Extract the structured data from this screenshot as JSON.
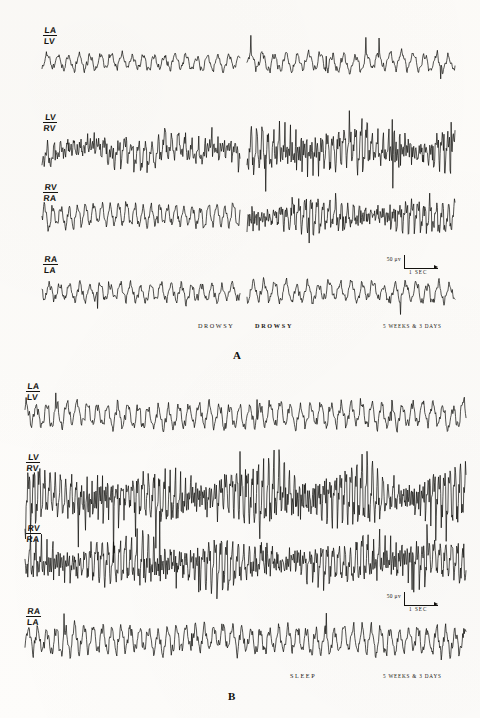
{
  "figure": {
    "type": "eeg-polygraph-recording",
    "width": 480,
    "height": 718,
    "background_color": "#fdfcfa",
    "trace_color": "#100f0d"
  },
  "panels": [
    {
      "id": "A",
      "letter": "A",
      "letter_pos": {
        "x": 233,
        "y": 349
      },
      "segmented": true,
      "segments": [
        {
          "x_start": 42,
          "x_end": 240
        },
        {
          "x_start": 247,
          "x_end": 455
        }
      ],
      "rows": [
        {
          "label_numerator": "LA",
          "label_denominator": "LV",
          "label_pos": {
            "x": 43,
            "y": 26
          },
          "baseline_y": 62,
          "segment_params": [
            {
              "amp": 6.5,
              "freq": 1.0,
              "noise": 0.52,
              "spindle": 0.1,
              "slow": 1.8,
              "seed": 11
            },
            {
              "amp": 7.2,
              "freq": 0.92,
              "noise": 0.56,
              "spindle": 0.14,
              "slow": 2.6,
              "seed": 12
            }
          ]
        },
        {
          "label_numerator": "LV",
          "label_denominator": "RV",
          "label_pos": {
            "x": 43,
            "y": 113
          },
          "baseline_y": 150,
          "segment_params": [
            {
              "amp": 11.5,
              "freq": 1.55,
              "noise": 0.3,
              "spindle": 0.55,
              "slow": 7.5,
              "seed": 21
            },
            {
              "amp": 15.5,
              "freq": 1.85,
              "noise": 0.22,
              "spindle": 0.8,
              "slow": 4.5,
              "seed": 22
            }
          ]
        },
        {
          "label_numerator": "RV",
          "label_denominator": "RA",
          "label_pos": {
            "x": 43,
            "y": 183
          },
          "baseline_y": 216,
          "segment_params": [
            {
              "amp": 8.0,
              "freq": 1.3,
              "noise": 0.45,
              "spindle": 0.25,
              "slow": 2.8,
              "seed": 31
            },
            {
              "amp": 12.5,
              "freq": 1.7,
              "noise": 0.32,
              "spindle": 0.6,
              "slow": 3.2,
              "seed": 32
            }
          ]
        },
        {
          "label_numerator": "RA",
          "label_denominator": "LA",
          "label_pos": {
            "x": 43,
            "y": 255
          },
          "baseline_y": 292,
          "segment_params": [
            {
              "amp": 6.8,
              "freq": 1.05,
              "noise": 0.58,
              "spindle": 0.12,
              "slow": 2.0,
              "seed": 41
            },
            {
              "amp": 7.6,
              "freq": 0.98,
              "noise": 0.6,
              "spindle": 0.16,
              "slow": 2.4,
              "seed": 42
            }
          ]
        }
      ],
      "calibration": {
        "pos": {
          "x": 404,
          "y": 255
        },
        "amplitude_label": "50 μv",
        "time_label": "1 SEC"
      },
      "annotations": [
        {
          "text": "DROWSY",
          "x": 198,
          "y": 322,
          "bold": false
        },
        {
          "text": "DROWSY",
          "x": 255,
          "y": 322,
          "bold": true
        },
        {
          "text": "5 WEEKS & 3 DAYS",
          "x": 383,
          "y": 323,
          "bold": false,
          "small": true
        }
      ]
    },
    {
      "id": "B",
      "letter": "B",
      "letter_pos": {
        "x": 228,
        "y": 690
      },
      "segmented": false,
      "segments": [
        {
          "x_start": 25,
          "x_end": 466
        }
      ],
      "rows": [
        {
          "label_numerator": "LA",
          "label_denominator": "LV",
          "label_pos": {
            "x": 26,
            "y": 382
          },
          "baseline_y": 415,
          "segment_params": [
            {
              "amp": 9.5,
              "freq": 1.05,
              "noise": 0.55,
              "spindle": 0.18,
              "slow": 3.2,
              "seed": 51
            }
          ]
        },
        {
          "label_numerator": "LV",
          "label_denominator": "RV",
          "label_pos": {
            "x": 26,
            "y": 453
          },
          "baseline_y": 495,
          "segment_params": [
            {
              "amp": 19.0,
              "freq": 1.95,
              "noise": 0.26,
              "spindle": 0.95,
              "slow": 6.0,
              "seed": 61
            }
          ]
        },
        {
          "label_numerator": "RV",
          "label_denominator": "RA",
          "label_pos": {
            "x": 26,
            "y": 524
          },
          "baseline_y": 562,
          "segment_params": [
            {
              "amp": 16.0,
              "freq": 1.8,
              "noise": 0.34,
              "spindle": 0.78,
              "slow": 4.0,
              "seed": 71
            }
          ]
        },
        {
          "label_numerator": "RA",
          "label_denominator": "LA",
          "label_pos": {
            "x": 26,
            "y": 607
          },
          "baseline_y": 640,
          "segment_params": [
            {
              "amp": 10.0,
              "freq": 1.15,
              "noise": 0.6,
              "spindle": 0.22,
              "slow": 2.6,
              "seed": 81
            }
          ]
        }
      ],
      "calibration": {
        "pos": {
          "x": 404,
          "y": 592
        },
        "amplitude_label": "50 μv",
        "time_label": "1 SEC"
      },
      "annotations": [
        {
          "text": "SLEEP",
          "x": 290,
          "y": 672,
          "bold": false
        },
        {
          "text": "5 WEEKS & 3 DAYS",
          "x": 383,
          "y": 673,
          "bold": false,
          "small": true
        }
      ]
    }
  ],
  "chart_data": {
    "type": "line",
    "title": "",
    "xlabel": "time",
    "ylabel": "amplitude",
    "recording_channels": [
      "LA/LV",
      "LV/RV",
      "RV/RA",
      "RA/LA"
    ],
    "calibration_amplitude": "50 μv",
    "calibration_time": "1 SEC",
    "subject_age": "5 WEEKS & 3 DAYS",
    "states": [
      "DROWSY",
      "DROWSY",
      "SLEEP"
    ],
    "panels": [
      "A",
      "B"
    ]
  }
}
